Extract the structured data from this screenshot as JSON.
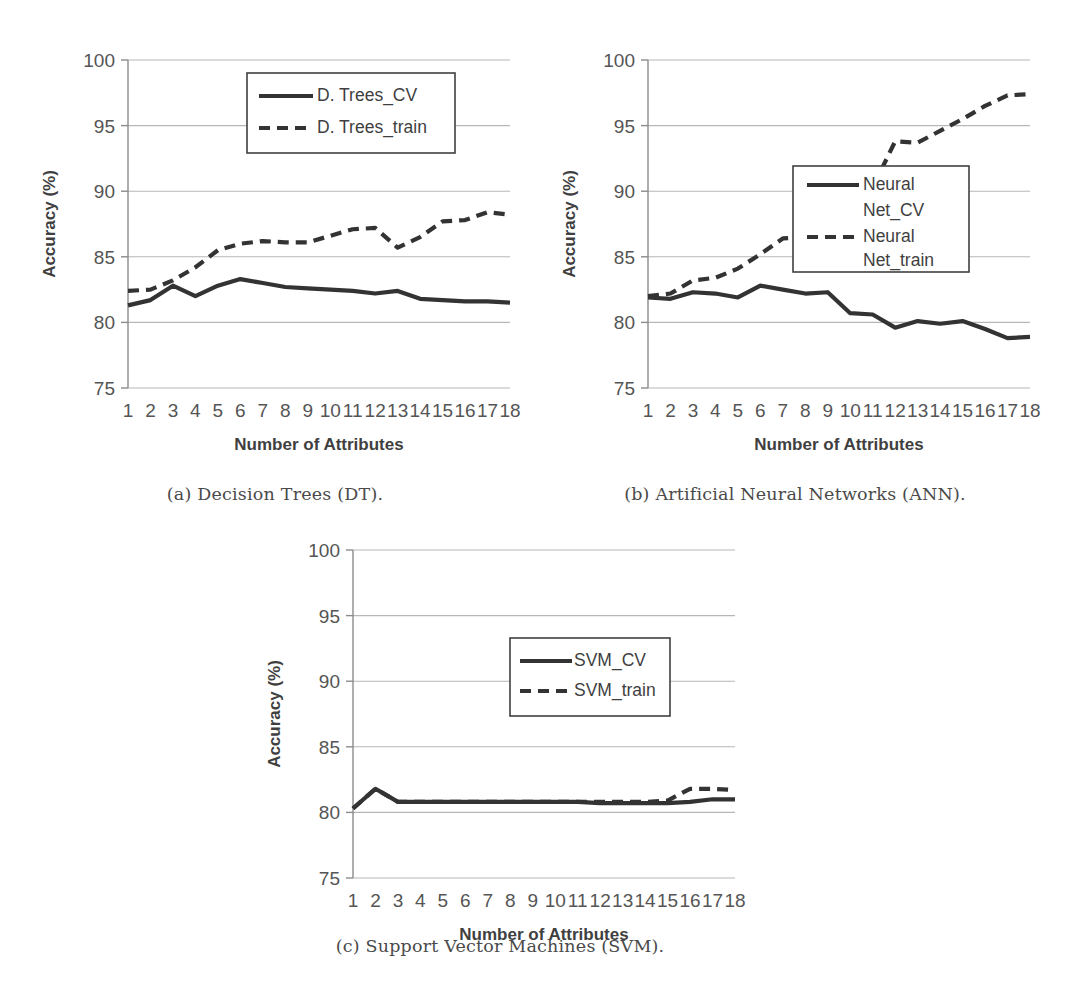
{
  "page": {
    "kind": "multi-panel-figure"
  },
  "captions": {
    "a": "(a) Decision Trees (DT).",
    "b": "(b) Artificial Neural Networks (ANN).",
    "c": "(c) Support Vector Machines (SVM)."
  },
  "axes": {
    "ylabel": "Accuracy (%)",
    "xlabel": "Number of Attributes",
    "yticks": [
      "100",
      "95",
      "90",
      "85",
      "80",
      "75"
    ],
    "xticks": [
      "1",
      "2",
      "3",
      "4",
      "5",
      "6",
      "7",
      "8",
      "9",
      "10",
      "11",
      "12",
      "13",
      "14",
      "15",
      "16",
      "17",
      "18"
    ]
  },
  "colors": {
    "series_solid": "#333333",
    "series_dashed": "#333333",
    "gridline": "#b7b7b7",
    "axis": "#8c8c8c",
    "text": "#555555",
    "caption": "#4a4a4a",
    "background": "#ffffff"
  },
  "chart_data": [
    {
      "id": "a",
      "type": "line",
      "title": "(a) Decision Trees (DT).",
      "xlabel": "Number of Attributes",
      "ylabel": "Accuracy (%)",
      "ylim": [
        75,
        100
      ],
      "ytick_step": 5,
      "grid": true,
      "legend_position": "upper-right-inside",
      "x": [
        1,
        2,
        3,
        4,
        5,
        6,
        7,
        8,
        9,
        10,
        11,
        12,
        13,
        14,
        15,
        16,
        17,
        18
      ],
      "series": [
        {
          "name": "D. Trees_CV",
          "style": "solid",
          "values": [
            81.3,
            81.7,
            82.8,
            82.0,
            82.8,
            83.3,
            83.0,
            82.7,
            82.6,
            82.5,
            82.4,
            82.2,
            82.4,
            81.8,
            81.7,
            81.6,
            81.6,
            81.5
          ]
        },
        {
          "name": "D. Trees_train",
          "style": "dashed",
          "values": [
            82.4,
            82.5,
            83.2,
            84.2,
            85.5,
            86.0,
            86.2,
            86.1,
            86.1,
            86.6,
            87.1,
            87.2,
            85.7,
            86.5,
            87.7,
            87.8,
            88.4,
            88.2
          ]
        }
      ]
    },
    {
      "id": "b",
      "type": "line",
      "title": "(b) Artificial Neural Networks (ANN).",
      "xlabel": "Number of Attributes",
      "ylabel": "Accuracy (%)",
      "ylim": [
        75,
        100
      ],
      "ytick_step": 5,
      "grid": true,
      "legend_position": "middle-right-inside",
      "x": [
        1,
        2,
        3,
        4,
        5,
        6,
        7,
        8,
        9,
        10,
        11,
        12,
        13,
        14,
        15,
        16,
        17,
        18
      ],
      "series": [
        {
          "name": "Neural Net_CV",
          "style": "solid",
          "values": [
            81.9,
            81.8,
            82.3,
            82.2,
            81.9,
            82.8,
            82.5,
            82.2,
            82.3,
            80.7,
            80.6,
            79.6,
            80.1,
            79.9,
            80.1,
            79.5,
            78.8,
            78.9
          ]
        },
        {
          "name": "Neural Net_train",
          "style": "dashed",
          "values": [
            82.0,
            82.2,
            83.2,
            83.4,
            84.1,
            85.2,
            86.4,
            86.5,
            86.0,
            88.3,
            90.3,
            93.8,
            93.7,
            94.6,
            95.5,
            96.5,
            97.3,
            97.4
          ]
        }
      ]
    },
    {
      "id": "c",
      "type": "line",
      "title": "(c) Support Vector Machines (SVM).",
      "xlabel": "Number of Attributes",
      "ylabel": "Accuracy (%)",
      "ylim": [
        75,
        100
      ],
      "ytick_step": 5,
      "grid": true,
      "legend_position": "middle-right-inside",
      "x": [
        1,
        2,
        3,
        4,
        5,
        6,
        7,
        8,
        9,
        10,
        11,
        12,
        13,
        14,
        15,
        16,
        17,
        18
      ],
      "series": [
        {
          "name": "SVM_CV",
          "style": "solid",
          "values": [
            80.3,
            81.8,
            80.8,
            80.8,
            80.8,
            80.8,
            80.8,
            80.8,
            80.8,
            80.8,
            80.8,
            80.7,
            80.7,
            80.7,
            80.7,
            80.8,
            81.0,
            81.0
          ]
        },
        {
          "name": "SVM_train",
          "style": "dashed",
          "values": [
            80.3,
            81.8,
            80.8,
            80.8,
            80.8,
            80.8,
            80.8,
            80.8,
            80.8,
            80.8,
            80.8,
            80.8,
            80.8,
            80.8,
            80.9,
            81.8,
            81.8,
            81.7
          ]
        }
      ]
    }
  ],
  "legends": {
    "a": [
      "D. Trees_CV",
      "D. Trees_train"
    ],
    "b": [
      "Neural",
      "Net_CV",
      "Neural",
      "Net_train"
    ],
    "c": [
      "SVM_CV",
      "SVM_train"
    ]
  }
}
